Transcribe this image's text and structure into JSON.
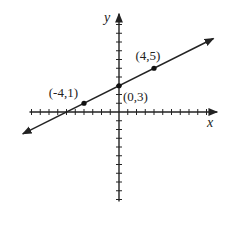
{
  "chart_data": {
    "type": "line",
    "title": "",
    "xlabel": "x",
    "ylabel": "y",
    "xlim": [
      -10,
      11
    ],
    "ylim": [
      -10,
      11
    ],
    "x_ticks": [
      -10,
      -9,
      -8,
      -7,
      -6,
      -5,
      -4,
      -3,
      -2,
      -1,
      1,
      2,
      3,
      4,
      5,
      6,
      7,
      8,
      9,
      10
    ],
    "y_ticks": [
      -10,
      -9,
      -8,
      -7,
      -6,
      -5,
      -4,
      -3,
      -2,
      -1,
      1,
      2,
      3,
      4,
      5,
      6,
      7,
      8,
      9,
      10
    ],
    "grid": false,
    "series": [
      {
        "name": "line",
        "equation": "y = 0.5x + 3",
        "slope": 0.5,
        "intercept": 3,
        "x_range": [
          -11,
          10.8
        ],
        "arrows": "both",
        "color": "#222222"
      }
    ],
    "points": [
      {
        "x": -4,
        "y": 1,
        "label": "(-4,1)",
        "label_position": "upper-left"
      },
      {
        "x": 0,
        "y": 3,
        "label": "(0,3)",
        "label_position": "lower-right"
      },
      {
        "x": 4,
        "y": 5,
        "label": "(4,5)",
        "label_position": "above"
      }
    ]
  }
}
